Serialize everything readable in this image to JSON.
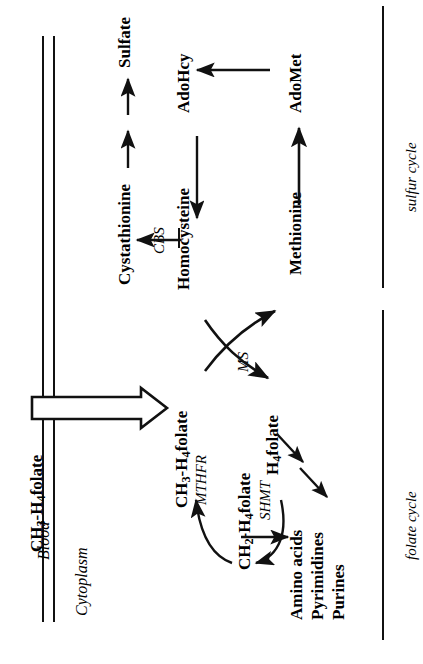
{
  "figure": {
    "type": "biochemical-pathway-diagram",
    "orientation": "rotated-90-ccw",
    "background": "#ffffff",
    "ink": "#111111"
  },
  "compartments": {
    "blood_label": "Blood",
    "cytoplasm_label": "Cytoplasm",
    "membrane": "double-line-plasma-membrane"
  },
  "transport": {
    "substrate_outside": "CH3-H4folate",
    "substrate_outside_parts": {
      "a": "CH",
      "sub1": "3",
      "b": "-H",
      "sub2": "4",
      "c": "folate"
    },
    "arrow": "hollow-block-arrow-right"
  },
  "metabolites": {
    "ch3_h4folate": {
      "a": "CH",
      "sub1": "3",
      "b": "-H",
      "sub2": "4",
      "c": "folate"
    },
    "ch2_h4folate": {
      "a": "CH",
      "sub1": "2",
      "b": "-H",
      "sub2": "4",
      "c": "folate"
    },
    "h4folate": {
      "a": "H",
      "sub1": "4",
      "c": "folate"
    },
    "homocysteine": "Homocysteine",
    "methionine": "Methionine",
    "adomet": "AdoMet",
    "adohcy": "AdoHcy",
    "cystathionine": "Cystathionine",
    "sulfate": "Sulfate",
    "products": {
      "line1": "Amino acids",
      "line2": "Pyrimidines",
      "line3": "Purines"
    }
  },
  "enzymes": {
    "mthfr": "MTHFR",
    "shmt": "SHMT",
    "ms": "MS",
    "cbs": "CBS"
  },
  "cycles": {
    "sulfur": "sulfur cycle",
    "folate": "folate cycle"
  }
}
